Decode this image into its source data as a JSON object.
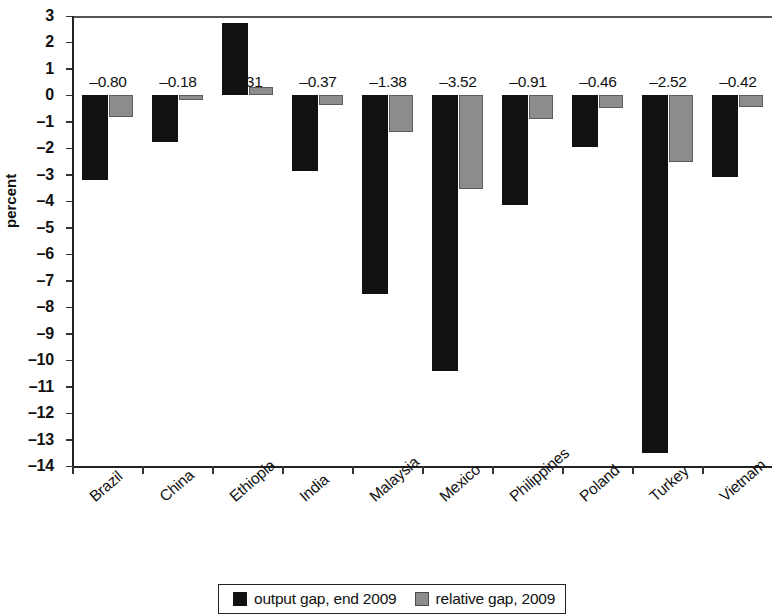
{
  "chart_data": {
    "type": "bar",
    "title": "",
    "xlabel": "",
    "ylabel": "percent",
    "ylim": [
      -14,
      3
    ],
    "yticks": [
      3,
      2,
      1,
      0,
      -1,
      -2,
      -3,
      -4,
      -5,
      -6,
      -7,
      -8,
      -9,
      -10,
      -11,
      -12,
      -13,
      -14
    ],
    "ytick_labels": [
      "3",
      "2",
      "1",
      "0",
      "–1",
      "–2",
      "–3",
      "–4",
      "–5",
      "–6",
      "–7",
      "–8",
      "–9",
      "–10",
      "–11",
      "–12",
      "–13",
      "–14"
    ],
    "grid": false,
    "legend_position": "bottom",
    "categories": [
      "Brazil",
      "China",
      "Ethiopia",
      "India",
      "Malaysia",
      "Mexico",
      "Philippines",
      "Poland",
      "Turkey",
      "Vietnam"
    ],
    "series": [
      {
        "name": "output gap, end 2009",
        "color": "#111111",
        "values": [
          -3.2,
          -1.75,
          2.75,
          -2.85,
          -7.5,
          -10.4,
          -4.15,
          -1.95,
          -13.5,
          -3.1
        ]
      },
      {
        "name": "relative gap, 2009",
        "color": "#8c8c8c",
        "values": [
          -0.8,
          -0.18,
          0.31,
          -0.37,
          -1.38,
          -3.52,
          -0.91,
          -0.46,
          -2.52,
          -0.42
        ],
        "data_labels": [
          "–0.80",
          "–0.18",
          "0.31",
          "–0.37",
          "–1.38",
          "–3.52",
          "–0.91",
          "–0.46",
          "–2.52",
          "–0.42"
        ]
      }
    ]
  },
  "legend": {
    "items": [
      {
        "label": "output gap, end 2009",
        "swatch": "black"
      },
      {
        "label": "relative gap, 2009",
        "swatch": "gray"
      }
    ]
  }
}
